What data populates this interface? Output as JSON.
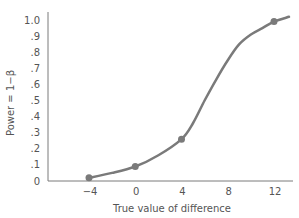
{
  "chart_data": {
    "type": "line",
    "title": "",
    "xlabel": "True value of difference",
    "ylabel": "Power = 1−β",
    "x_ticks": [
      "−4",
      "0",
      "4",
      "8",
      "12"
    ],
    "x_tick_values": [
      -4,
      0,
      4,
      8,
      12
    ],
    "y_ticks": [
      "0",
      ".1",
      ".2",
      ".3",
      ".4",
      ".5",
      ".6",
      ".7",
      ".8",
      ".9",
      "1.0"
    ],
    "y_tick_values": [
      0,
      0.1,
      0.2,
      0.3,
      0.4,
      0.5,
      0.6,
      0.7,
      0.8,
      0.9,
      1.0
    ],
    "xlim": [
      -6,
      13.5
    ],
    "ylim": [
      0,
      1.0
    ],
    "grid": false,
    "legend": null,
    "series": [
      {
        "name": "Power curve",
        "color": "#7a7a7a",
        "points": [
          {
            "x": -4,
            "y": 0.02
          },
          {
            "x": 0,
            "y": 0.09
          },
          {
            "x": 4,
            "y": 0.26
          },
          {
            "x": 12,
            "y": 0.99
          }
        ],
        "curve": [
          {
            "x": -4,
            "y": 0.02
          },
          {
            "x": -2,
            "y": 0.05
          },
          {
            "x": 0,
            "y": 0.09
          },
          {
            "x": 2,
            "y": 0.16
          },
          {
            "x": 4,
            "y": 0.26
          },
          {
            "x": 5,
            "y": 0.36
          },
          {
            "x": 6,
            "y": 0.5
          },
          {
            "x": 7,
            "y": 0.63
          },
          {
            "x": 8,
            "y": 0.75
          },
          {
            "x": 9,
            "y": 0.85
          },
          {
            "x": 10,
            "y": 0.91
          },
          {
            "x": 11,
            "y": 0.95
          },
          {
            "x": 12,
            "y": 0.99
          },
          {
            "x": 13.3,
            "y": 1.02
          }
        ]
      }
    ]
  }
}
